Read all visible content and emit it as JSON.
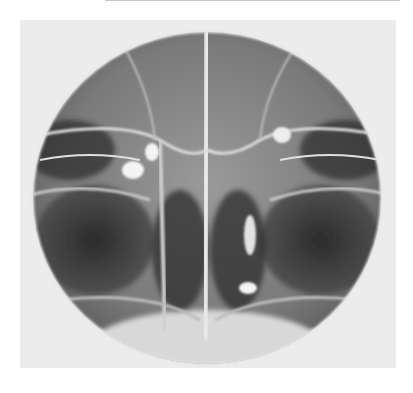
{
  "image": {
    "subject": "circular frontal radiograph of the paranasal sinuses and nasal cavity",
    "background_color": "#ffffff",
    "frame_color": "#ececec",
    "field_shape": "circle"
  }
}
